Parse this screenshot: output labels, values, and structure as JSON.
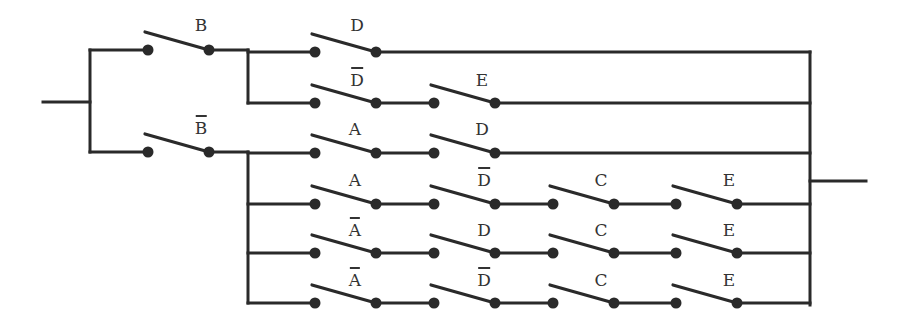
{
  "diagram": {
    "type": "switching-circuit",
    "colors": {
      "line": "#2a2a2a",
      "background": "#ffffff"
    },
    "input_terminal": {
      "x1": 43,
      "x2": 90,
      "y": 102
    },
    "output_terminal": {
      "x1": 810,
      "x2": 866,
      "y": 181
    },
    "left_bus": {
      "x": 90,
      "y1": 50,
      "y2": 152
    },
    "right_bus": {
      "x": 810,
      "y1": 52,
      "y2": 305
    },
    "first_stage": [
      {
        "label": "B",
        "negated": false,
        "x": 148,
        "y": 50
      },
      {
        "label": "B",
        "negated": true,
        "x": 148,
        "y": 152
      }
    ],
    "branch_buses": [
      {
        "x": 248,
        "y1": 50,
        "y2": 103
      },
      {
        "x": 248,
        "y1": 152,
        "y2": 303
      }
    ],
    "rows": [
      {
        "y": 52,
        "switches": [
          {
            "label": "D",
            "negated": false,
            "x": 315
          }
        ]
      },
      {
        "y": 103,
        "switches": [
          {
            "label": "D",
            "negated": true,
            "x": 315
          },
          {
            "label": "E",
            "negated": false,
            "x": 434
          }
        ]
      },
      {
        "y": 153,
        "switches": [
          {
            "label": "A",
            "negated": false,
            "x": 315
          },
          {
            "label": "D",
            "negated": false,
            "x": 434
          }
        ]
      },
      {
        "y": 204,
        "switches": [
          {
            "label": "A",
            "negated": false,
            "x": 315
          },
          {
            "label": "D",
            "negated": true,
            "x": 434
          },
          {
            "label": "C",
            "negated": false,
            "x": 553
          },
          {
            "label": "E",
            "negated": false,
            "x": 676
          }
        ]
      },
      {
        "y": 253,
        "switches": [
          {
            "label": "A",
            "negated": true,
            "x": 315
          },
          {
            "label": "D",
            "negated": false,
            "x": 434
          },
          {
            "label": "C",
            "negated": false,
            "x": 553
          },
          {
            "label": "E",
            "negated": false,
            "x": 676
          }
        ]
      },
      {
        "y": 303,
        "switches": [
          {
            "label": "A",
            "negated": true,
            "x": 315
          },
          {
            "label": "D",
            "negated": true,
            "x": 434
          },
          {
            "label": "C",
            "negated": false,
            "x": 553
          },
          {
            "label": "E",
            "negated": false,
            "x": 676
          }
        ]
      }
    ],
    "labels": {
      "b_top": "B",
      "b_bottom": "B",
      "r0s0": "D",
      "r1s0": "D",
      "r1s1": "E",
      "r2s0": "A",
      "r2s1": "D",
      "r3s0": "A",
      "r3s1": "D",
      "r3s2": "C",
      "r3s3": "E",
      "r4s0": "A",
      "r4s1": "D",
      "r4s2": "C",
      "r4s3": "E",
      "r5s0": "A",
      "r5s1": "D",
      "r5s2": "C",
      "r5s3": "E"
    }
  }
}
